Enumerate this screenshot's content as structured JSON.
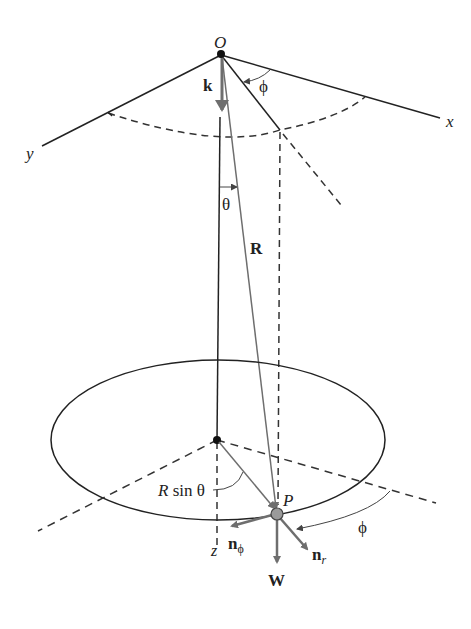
{
  "diagram": {
    "type": "spherical pendulum geometry",
    "labels": {
      "origin": "O",
      "x_axis": "x",
      "y_axis": "y",
      "z_axis": "z",
      "k_vector": "k",
      "phi_top": "ϕ",
      "theta": "θ",
      "R_vector": "R",
      "radius_label": "R sin θ",
      "point": "P",
      "n_phi": "n",
      "n_phi_sub": "ϕ",
      "n_r": "n",
      "n_r_sub": "r",
      "weight": "W",
      "phi_bottom": "ϕ"
    },
    "colors": {
      "line": "#222222",
      "vector_gray": "#6e6e6e",
      "background": "#ffffff"
    }
  }
}
